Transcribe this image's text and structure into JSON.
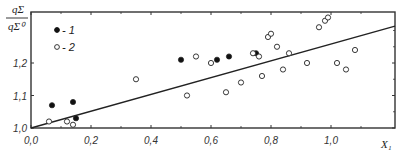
{
  "chart_data": {
    "type": "scatter",
    "title": "",
    "xlabel": "X1",
    "ylabel": "qΣ / qΣ0",
    "xlim": [
      0.0,
      1.2
    ],
    "ylim": [
      1.0,
      1.35
    ],
    "x_ticks": [
      "0,0",
      "0,2",
      "0,4",
      "0,6",
      "0,8",
      "1,0"
    ],
    "y_ticks": [
      "1,0",
      "1,1",
      "1,2"
    ],
    "grid": false,
    "legend_position": "upper-left",
    "series": [
      {
        "name": "1",
        "marker": "filled-circle",
        "points": [
          [
            0.07,
            1.07
          ],
          [
            0.14,
            1.08
          ],
          [
            0.15,
            1.03
          ],
          [
            0.5,
            1.21
          ],
          [
            0.62,
            1.21
          ],
          [
            0.66,
            1.22
          ],
          [
            0.75,
            1.23
          ]
        ]
      },
      {
        "name": "2",
        "marker": "open-circle",
        "points": [
          [
            0.06,
            1.02
          ],
          [
            0.12,
            1.02
          ],
          [
            0.14,
            1.01
          ],
          [
            0.35,
            1.15
          ],
          [
            0.52,
            1.1
          ],
          [
            0.55,
            1.22
          ],
          [
            0.6,
            1.2
          ],
          [
            0.65,
            1.11
          ],
          [
            0.7,
            1.14
          ],
          [
            0.74,
            1.23
          ],
          [
            0.76,
            1.22
          ],
          [
            0.77,
            1.16
          ],
          [
            0.79,
            1.28
          ],
          [
            0.8,
            1.29
          ],
          [
            0.82,
            1.25
          ],
          [
            0.84,
            1.18
          ],
          [
            0.86,
            1.23
          ],
          [
            0.92,
            1.2
          ],
          [
            0.96,
            1.31
          ],
          [
            0.98,
            1.33
          ],
          [
            0.99,
            1.34
          ],
          [
            1.02,
            1.2
          ],
          [
            1.05,
            1.18
          ],
          [
            1.08,
            1.24
          ]
        ]
      }
    ],
    "fit_line": {
      "label": "linear fit",
      "x": [
        0.0,
        1.2
      ],
      "y": [
        1.0,
        1.31
      ]
    },
    "annotations": []
  }
}
